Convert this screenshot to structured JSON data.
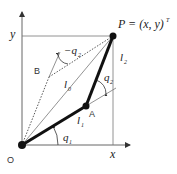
{
  "diagram": {
    "labels": {
      "P": "P = (x, y)",
      "P_sup": "T",
      "y_axis": "y",
      "x_axis": "x",
      "origin": "O",
      "A": "A",
      "B": "B",
      "l0": "l",
      "l0_sub": "0",
      "l1": "l",
      "l1_sub": "1",
      "l2": "l",
      "l2_sub": "2",
      "q1": "q",
      "q1_sub": "1",
      "q2": "q",
      "q2_sub": "2",
      "neg_q2": "−q",
      "neg_q2_sub": "2"
    },
    "points": {
      "O": [
        22,
        145
      ],
      "A": [
        86,
        106
      ],
      "P": [
        113,
        36
      ],
      "B_end": [
        60,
        52
      ],
      "B_knee": [
        49,
        77
      ]
    },
    "colors": {
      "link": "#111111",
      "axis": "#555555",
      "thin": "#666666"
    }
  }
}
